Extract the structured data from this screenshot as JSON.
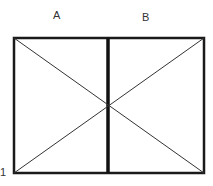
{
  "diagram": {
    "labels": {
      "left_top": "A",
      "right_top": "B",
      "bottom_left": "1"
    },
    "colors": {
      "stroke": "#1a1a1a",
      "text": "#333333"
    }
  }
}
